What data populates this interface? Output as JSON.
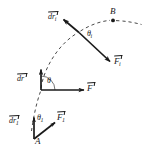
{
  "figure": {
    "background_color": "#ffffff",
    "ink_color": "#1a1a1a",
    "width": 147,
    "height": 154,
    "labels": {
      "point_a": "A",
      "point_b": "B",
      "dr_start_symbol": "dr",
      "dr_start_sub": "1",
      "force_start_symbol": "F",
      "force_start_sub": "1",
      "angle_start_symbol": "θ",
      "angle_start_sub": "1",
      "dr_mid_symbol": "dr",
      "dr_mid_sub": "",
      "force_mid_symbol": "F",
      "force_mid_sub": "",
      "angle_mid_symbol": "θ",
      "angle_mid_sub": "",
      "dr_i_symbol": "dr",
      "dr_i_sub": "i",
      "force_i_symbol": "F",
      "force_i_sub": "i",
      "angle_i_symbol": "θ",
      "angle_i_sub": "i"
    },
    "geometry": {
      "path_style": "dashed",
      "path_description": "dashed curve rising from point A at lower left, through the middle vertex, up to point B at upper right and continuing off to the right",
      "vertices": [
        {
          "name": "A",
          "x": 34,
          "y": 139
        },
        {
          "name": "mid",
          "x": 41,
          "y": 90
        },
        {
          "name": "i",
          "x": 79,
          "y": 32
        },
        {
          "name": "B",
          "x": 113,
          "y": 20
        }
      ],
      "vectors": [
        {
          "name": "dr_1",
          "from": [
            34,
            139
          ],
          "to": [
            34,
            116
          ],
          "direction": "up"
        },
        {
          "name": "F_1",
          "from": [
            34,
            139
          ],
          "to": [
            56,
            122
          ],
          "direction": "up-right"
        },
        {
          "name": "dr",
          "from": [
            41,
            90
          ],
          "to": [
            41,
            68
          ],
          "direction": "up"
        },
        {
          "name": "F",
          "from": [
            41,
            90
          ],
          "to": [
            86,
            90
          ],
          "direction": "right"
        },
        {
          "name": "dr_i",
          "from": [
            79,
            32
          ],
          "to": [
            62,
            18
          ],
          "direction": "up-left"
        },
        {
          "name": "F_i",
          "from": [
            79,
            32
          ],
          "to": [
            112,
            63
          ],
          "direction": "down-right"
        }
      ],
      "angle_arcs": [
        {
          "name": "theta_1",
          "vertex": [
            34,
            139
          ],
          "between": [
            "dr_1",
            "F_1"
          ]
        },
        {
          "name": "theta",
          "vertex": [
            41,
            90
          ],
          "between": [
            "dr",
            "F"
          ]
        },
        {
          "name": "theta_i",
          "vertex": [
            79,
            32
          ],
          "between": [
            "dr_i",
            "F_i"
          ]
        }
      ]
    }
  }
}
